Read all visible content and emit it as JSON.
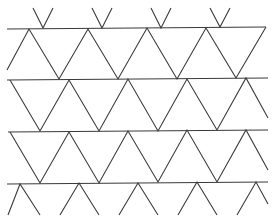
{
  "figure": {
    "width": 276,
    "height": 220,
    "stroke_color": "#3a3a3a",
    "background": "#ffffff",
    "horizontal_lines": [
      {
        "x1": 7,
        "y1": 29,
        "x2": 266,
        "y2": 27
      },
      {
        "x1": 7,
        "y1": 80,
        "x2": 268,
        "y2": 78
      },
      {
        "x1": 8,
        "y1": 132,
        "x2": 268,
        "y2": 130
      },
      {
        "x1": 7,
        "y1": 184,
        "x2": 268,
        "y2": 182
      }
    ],
    "zigzags": [
      {
        "name": "top-partial-vs",
        "segments": [
          [
            [
              33,
              8
            ],
            [
              43,
              28
            ],
            [
              53,
              8
            ]
          ],
          [
            [
              92,
              8
            ],
            [
              102,
              28
            ],
            [
              112,
              8
            ]
          ],
          [
            [
              151,
              8
            ],
            [
              161,
              28
            ],
            [
              171,
              8
            ]
          ],
          [
            [
              210,
              8
            ],
            [
              220,
              27
            ],
            [
              230,
              8
            ]
          ]
        ]
      },
      {
        "name": "band-1",
        "points": [
          [
            7,
            70
          ],
          [
            29,
            29
          ],
          [
            59,
            79
          ],
          [
            88,
            29
          ],
          [
            118,
            79
          ],
          [
            147,
            28
          ],
          [
            177,
            79
          ],
          [
            206,
            28
          ],
          [
            236,
            78
          ],
          [
            266,
            27
          ]
        ]
      },
      {
        "name": "band-2",
        "points": [
          [
            10,
            80
          ],
          [
            40,
            131
          ],
          [
            69,
            80
          ],
          [
            99,
            131
          ],
          [
            128,
            79
          ],
          [
            158,
            131
          ],
          [
            187,
            79
          ],
          [
            217,
            130
          ],
          [
            246,
            78
          ],
          [
            268,
            118
          ]
        ]
      },
      {
        "name": "band-3",
        "points": [
          [
            10,
            132
          ],
          [
            40,
            183
          ],
          [
            69,
            132
          ],
          [
            99,
            183
          ],
          [
            128,
            131
          ],
          [
            158,
            182
          ],
          [
            187,
            130
          ],
          [
            217,
            182
          ],
          [
            246,
            130
          ],
          [
            268,
            170
          ]
        ]
      },
      {
        "name": "band-4",
        "points": [
          [
            8,
            215
          ],
          [
            20,
            184
          ],
          [
            40,
            215
          ]
        ],
        "extra": [
          [
            [
              60,
              215
            ],
            [
              79,
              183
            ],
            [
              99,
              215
            ]
          ],
          [
            [
              119,
              215
            ],
            [
              138,
              183
            ],
            [
              158,
              215
            ]
          ],
          [
            [
              178,
              215
            ],
            [
              197,
              182
            ],
            [
              217,
              215
            ]
          ],
          [
            [
              237,
              215
            ],
            [
              256,
              182
            ],
            [
              268,
              204
            ]
          ]
        ]
      }
    ]
  }
}
